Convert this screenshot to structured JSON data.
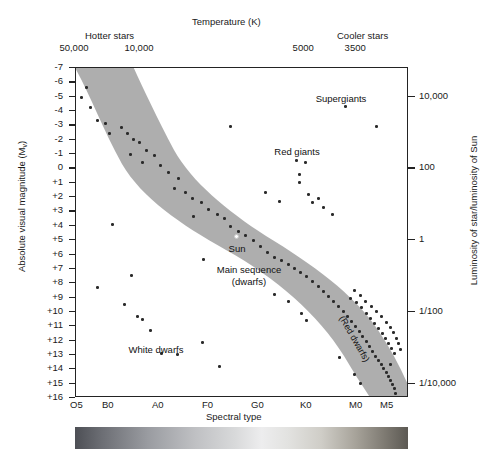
{
  "figure": {
    "type": "hertzsprung-russell-diagram",
    "top_axis_title": "Temperature (K)",
    "hotter_label": "Hotter stars",
    "cooler_label": "Cooler stars",
    "bottom_axis_title": "Spectral type",
    "left_axis_title_main": "Absolute visual magnitude (M",
    "left_axis_title_sub": "v",
    "left_axis_title_end": ")",
    "right_axis_title": "Luminosity of star/luminosity of Sun",
    "spectrum_bar": "visible-spectrum-strip"
  },
  "chart_data": {
    "type": "scatter",
    "xlabel": "Spectral type",
    "ylabel": "Absolute visual magnitude (Mv)",
    "x2label": "Temperature (K)",
    "y2label": "Luminosity of star/luminosity of Sun",
    "grid": false,
    "legend": "none",
    "xlim_spectral": [
      "O5",
      "M5"
    ],
    "ylim_magnitude": [
      -7,
      16
    ],
    "temperature_ticks": [
      {
        "label": "50,000",
        "x_px": 75
      },
      {
        "label": "",
        "x_px": 90
      },
      {
        "label": "10,000",
        "x_px": 140
      },
      {
        "label": "",
        "x_px": 195
      },
      {
        "label": "",
        "x_px": 250
      },
      {
        "label": "5000",
        "x_px": 303
      },
      {
        "label": "3500",
        "x_px": 355
      },
      {
        "label": "",
        "x_px": 382
      },
      {
        "label": "",
        "x_px": 405
      }
    ],
    "spectral_ticks": [
      {
        "label": "O5",
        "x_px": 77
      },
      {
        "label": "B0",
        "x_px": 109
      },
      {
        "label": "A0",
        "x_px": 159
      },
      {
        "label": "F0",
        "x_px": 209
      },
      {
        "label": "G0",
        "x_px": 258
      },
      {
        "label": "K0",
        "x_px": 307
      },
      {
        "label": "M0",
        "x_px": 356
      },
      {
        "label": "M5",
        "x_px": 387
      }
    ],
    "magnitude_ticks": [
      "-7",
      "-6",
      "-5",
      "-4",
      "-3",
      "-2",
      "-1",
      "0",
      "+1",
      "+2",
      "+3",
      "+4",
      "+5",
      "+6",
      "+7",
      "+8",
      "+9",
      "+10",
      "+11",
      "+12",
      "+13",
      "+14",
      "+15",
      "+16"
    ],
    "luminosity_ticks": [
      {
        "label": "10,000",
        "mag": -5
      },
      {
        "label": "100",
        "mag": 0
      },
      {
        "label": "1",
        "mag": 5
      },
      {
        "label": "1/100",
        "mag": 10
      },
      {
        "label": "1/10,000",
        "mag": 15
      }
    ],
    "annotations": [
      {
        "text": "Supergiants",
        "x_px": 340,
        "y_px": 92
      },
      {
        "text": "Red giants",
        "x_px": 296,
        "y_px": 145
      },
      {
        "text": "Sun",
        "x_px": 236,
        "y_px": 242
      },
      {
        "text": "Main sequence",
        "x_px": 248,
        "y_px": 263
      },
      {
        "text": "(dwarfs)",
        "x_px": 248,
        "y_px": 275
      },
      {
        "text": "White dwarfs",
        "x_px": 155,
        "y_px": 343
      },
      {
        "text": "(Red dwarfs)",
        "x_px": 345,
        "y_px": 313
      }
    ],
    "main_sequence_band": "broad diagonal grey band from upper-left (hot, luminous) to lower-right (cool, faint)",
    "stars": [
      {
        "x": 84,
        "y": 85
      },
      {
        "x": 79,
        "y": 95
      },
      {
        "x": 88,
        "y": 105
      },
      {
        "x": 95,
        "y": 118
      },
      {
        "x": 103,
        "y": 121
      },
      {
        "x": 107,
        "y": 131
      },
      {
        "x": 119,
        "y": 125
      },
      {
        "x": 125,
        "y": 131
      },
      {
        "x": 131,
        "y": 137
      },
      {
        "x": 137,
        "y": 140
      },
      {
        "x": 128,
        "y": 152
      },
      {
        "x": 144,
        "y": 148
      },
      {
        "x": 152,
        "y": 153
      },
      {
        "x": 140,
        "y": 160
      },
      {
        "x": 158,
        "y": 163
      },
      {
        "x": 166,
        "y": 170
      },
      {
        "x": 176,
        "y": 176
      },
      {
        "x": 172,
        "y": 186
      },
      {
        "x": 183,
        "y": 190
      },
      {
        "x": 190,
        "y": 196
      },
      {
        "x": 199,
        "y": 200
      },
      {
        "x": 206,
        "y": 207
      },
      {
        "x": 215,
        "y": 212
      },
      {
        "x": 222,
        "y": 216
      },
      {
        "x": 228,
        "y": 224
      },
      {
        "x": 236,
        "y": 229
      },
      {
        "x": 243,
        "y": 233
      },
      {
        "x": 251,
        "y": 238
      },
      {
        "x": 258,
        "y": 244
      },
      {
        "x": 265,
        "y": 250
      },
      {
        "x": 272,
        "y": 255
      },
      {
        "x": 279,
        "y": 258
      },
      {
        "x": 286,
        "y": 262
      },
      {
        "x": 292,
        "y": 266
      },
      {
        "x": 298,
        "y": 270
      },
      {
        "x": 304,
        "y": 274
      },
      {
        "x": 310,
        "y": 279
      },
      {
        "x": 316,
        "y": 284
      },
      {
        "x": 321,
        "y": 289
      },
      {
        "x": 326,
        "y": 294
      },
      {
        "x": 331,
        "y": 299
      },
      {
        "x": 336,
        "y": 304
      },
      {
        "x": 341,
        "y": 309
      },
      {
        "x": 345,
        "y": 314
      },
      {
        "x": 349,
        "y": 319
      },
      {
        "x": 353,
        "y": 324
      },
      {
        "x": 357,
        "y": 329
      },
      {
        "x": 360,
        "y": 334
      },
      {
        "x": 364,
        "y": 339
      },
      {
        "x": 367,
        "y": 344
      },
      {
        "x": 370,
        "y": 349
      },
      {
        "x": 373,
        "y": 354
      },
      {
        "x": 376,
        "y": 358
      },
      {
        "x": 379,
        "y": 362
      },
      {
        "x": 381,
        "y": 366
      },
      {
        "x": 384,
        "y": 370
      },
      {
        "x": 386,
        "y": 374
      },
      {
        "x": 388,
        "y": 378
      },
      {
        "x": 390,
        "y": 382
      },
      {
        "x": 392,
        "y": 386
      },
      {
        "x": 348,
        "y": 296
      },
      {
        "x": 354,
        "y": 300
      },
      {
        "x": 359,
        "y": 305
      },
      {
        "x": 364,
        "y": 311
      },
      {
        "x": 368,
        "y": 316
      },
      {
        "x": 372,
        "y": 321
      },
      {
        "x": 376,
        "y": 326
      },
      {
        "x": 380,
        "y": 331
      },
      {
        "x": 383,
        "y": 336
      },
      {
        "x": 386,
        "y": 341
      },
      {
        "x": 389,
        "y": 346
      },
      {
        "x": 392,
        "y": 351
      },
      {
        "x": 352,
        "y": 288
      },
      {
        "x": 358,
        "y": 293
      },
      {
        "x": 363,
        "y": 299
      },
      {
        "x": 369,
        "y": 304
      },
      {
        "x": 374,
        "y": 309
      },
      {
        "x": 379,
        "y": 314
      },
      {
        "x": 384,
        "y": 320
      },
      {
        "x": 388,
        "y": 325
      },
      {
        "x": 391,
        "y": 330
      },
      {
        "x": 394,
        "y": 336
      },
      {
        "x": 396,
        "y": 341
      },
      {
        "x": 398,
        "y": 347
      },
      {
        "x": 343,
        "y": 104
      },
      {
        "x": 374,
        "y": 124
      },
      {
        "x": 228,
        "y": 124
      },
      {
        "x": 294,
        "y": 158
      },
      {
        "x": 303,
        "y": 160
      },
      {
        "x": 297,
        "y": 172
      },
      {
        "x": 297,
        "y": 180
      },
      {
        "x": 306,
        "y": 192
      },
      {
        "x": 310,
        "y": 200
      },
      {
        "x": 316,
        "y": 196
      },
      {
        "x": 321,
        "y": 205
      },
      {
        "x": 330,
        "y": 212
      },
      {
        "x": 277,
        "y": 199
      },
      {
        "x": 263,
        "y": 190
      },
      {
        "x": 110,
        "y": 222
      },
      {
        "x": 191,
        "y": 214
      },
      {
        "x": 201,
        "y": 257
      },
      {
        "x": 129,
        "y": 273
      },
      {
        "x": 95,
        "y": 285
      },
      {
        "x": 122,
        "y": 302
      },
      {
        "x": 135,
        "y": 314
      },
      {
        "x": 140,
        "y": 317
      },
      {
        "x": 148,
        "y": 328
      },
      {
        "x": 159,
        "y": 351
      },
      {
        "x": 175,
        "y": 352
      },
      {
        "x": 200,
        "y": 340
      },
      {
        "x": 217,
        "y": 364
      },
      {
        "x": 299,
        "y": 311
      },
      {
        "x": 304,
        "y": 318
      },
      {
        "x": 286,
        "y": 299
      },
      {
        "x": 272,
        "y": 292
      },
      {
        "x": 337,
        "y": 355
      },
      {
        "x": 352,
        "y": 372
      },
      {
        "x": 358,
        "y": 381
      },
      {
        "x": 388,
        "y": 362
      },
      {
        "x": 393,
        "y": 391
      }
    ],
    "sun_point": {
      "x": 233,
      "y": 233,
      "label": "Sun"
    }
  }
}
